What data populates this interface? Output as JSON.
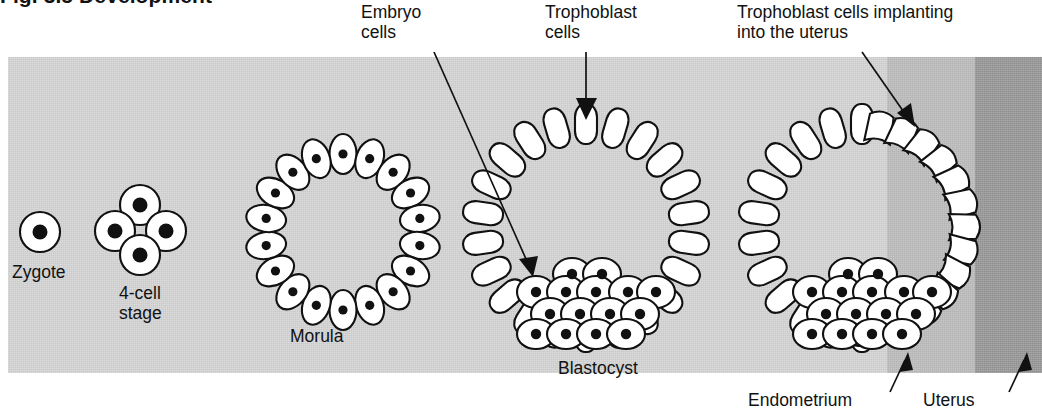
{
  "figure": {
    "heading_clipped": "Fig. 3.5  Development",
    "bottom_clipped": "Implantation",
    "panel_background": "#c9c9c9",
    "endometrium_band_color": "#b4b4b4",
    "uterus_band_color": "#8f8f8f",
    "cell_fill_color": "#ffffff",
    "outline_color": "#111111"
  },
  "callouts": [
    {
      "id": "embryo-cells",
      "text": "Embryo\ncells"
    },
    {
      "id": "trophoblast-cells",
      "text": "Trophoblast\ncells"
    },
    {
      "id": "implanting",
      "text": "Trophoblast cells implanting\ninto the uterus"
    }
  ],
  "stages": [
    {
      "id": "zygote",
      "label": "Zygote",
      "cell_count": 1
    },
    {
      "id": "four-cell",
      "label": "4-cell\nstage",
      "cell_count": 4
    },
    {
      "id": "morula",
      "label": "Morula",
      "cell_count": 18
    },
    {
      "id": "blastocyst",
      "label": "Blastocyst",
      "cell_count": 22
    },
    {
      "id": "implanting-blastocyst",
      "label": "",
      "cell_count": 22
    }
  ],
  "tissues": [
    {
      "id": "endometrium",
      "label": "Endometrium"
    },
    {
      "id": "uterus",
      "label": "Uterus"
    }
  ]
}
